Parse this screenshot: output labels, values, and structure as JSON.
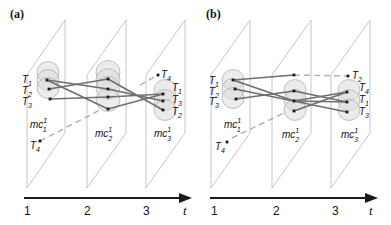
{
  "colors": {
    "plane": "#b8b8b8",
    "cluster_fill": "#dcdcdc",
    "cluster_stroke": "#a8a8a8",
    "link": "#6e6e6e",
    "dash": "#b0b0b0",
    "point": "#1a1a1a",
    "axis": "#1a1a1a"
  },
  "panels": [
    {
      "id": "a",
      "label": "(a)",
      "label_pos": [
        10,
        18
      ],
      "axis": {
        "x1": 24,
        "x2": 192,
        "y": 198,
        "ticks": [
          {
            "label": "1",
            "x": 27
          },
          {
            "label": "2",
            "x": 87
          },
          {
            "label": "3",
            "x": 146
          }
        ],
        "t_label": "t",
        "t_x": 183
      },
      "planes": [
        {
          "left_x": 27,
          "right_x": 65,
          "top_y": 20,
          "bottom_y": 188,
          "skew": 55
        },
        {
          "left_x": 87,
          "right_x": 126,
          "top_y": 20,
          "bottom_y": 188,
          "skew": 55
        },
        {
          "left_x": 146,
          "right_x": 185,
          "top_y": 20,
          "bottom_y": 188,
          "skew": 55
        }
      ],
      "clusters": [
        {
          "name": "mc",
          "sub": "1",
          "sup": "1",
          "label_pos": [
            30,
            128
          ],
          "circles": [
            [
              48,
              72
            ],
            [
              48,
              80
            ],
            [
              48,
              88
            ]
          ],
          "r": 11
        },
        {
          "name": "mc",
          "sub": "2",
          "sup": "1",
          "label_pos": [
            95,
            137
          ],
          "circles": [
            [
              108,
              72
            ],
            [
              108,
              80
            ],
            [
              108,
              88
            ],
            [
              108,
              100
            ]
          ],
          "r": 12
        },
        {
          "name": "mc",
          "sub": "3",
          "sup": "1",
          "label_pos": [
            154,
            137
          ],
          "circles": [
            [
              165,
              90
            ],
            [
              165,
              100
            ],
            [
              165,
              110
            ]
          ],
          "r": 11
        }
      ],
      "points": [
        {
          "id": "p1a",
          "x": 47,
          "y": 80
        },
        {
          "id": "p1b",
          "x": 49,
          "y": 89
        },
        {
          "id": "p1c",
          "x": 50,
          "y": 99
        },
        {
          "id": "p2a",
          "x": 108,
          "y": 79
        },
        {
          "id": "p2b",
          "x": 108,
          "y": 89
        },
        {
          "id": "p2c",
          "x": 108,
          "y": 97
        },
        {
          "id": "p2d",
          "x": 108,
          "y": 109
        },
        {
          "id": "p3a",
          "x": 163,
          "y": 94
        },
        {
          "id": "p3b",
          "x": 163,
          "y": 101
        },
        {
          "id": "p3c",
          "x": 163,
          "y": 110
        },
        {
          "id": "p3d",
          "x": 158,
          "y": 75
        },
        {
          "id": "p1t4",
          "x": 40,
          "y": 141
        }
      ],
      "links": [
        [
          "p1a",
          "p2b"
        ],
        [
          "p1a",
          "p2d"
        ],
        [
          "p1b",
          "p2a"
        ],
        [
          "p1c",
          "p2c"
        ],
        [
          "p2a",
          "p3c"
        ],
        [
          "p2b",
          "p3b"
        ],
        [
          "p2c",
          "p3a"
        ],
        [
          "p2d",
          "p3a"
        ]
      ],
      "dashes": [
        {
          "x1": 40,
          "y1": 141,
          "x2": 100,
          "y2": 110
        },
        {
          "x1": 140,
          "y1": 85,
          "x2": 158,
          "y2": 75
        }
      ],
      "traj_labels": [
        {
          "text": "T",
          "sub": "1",
          "x": 22,
          "y": 83
        },
        {
          "text": "T",
          "sub": "2",
          "x": 22,
          "y": 94
        },
        {
          "text": "T",
          "sub": "3",
          "x": 22,
          "y": 105
        },
        {
          "text": "T",
          "sub": "4",
          "x": 30,
          "y": 149
        },
        {
          "text": "T",
          "sub": "4",
          "x": 161,
          "y": 78
        },
        {
          "text": "T",
          "sub": "1",
          "x": 172,
          "y": 91
        },
        {
          "text": "T",
          "sub": "3",
          "x": 172,
          "y": 103
        },
        {
          "text": "T",
          "sub": "2",
          "x": 172,
          "y": 115
        }
      ]
    },
    {
      "id": "b",
      "label": "(b)",
      "label_pos": [
        206,
        18
      ],
      "axis": {
        "x1": 210,
        "x2": 378,
        "y": 198,
        "ticks": [
          {
            "label": "1",
            "x": 214
          },
          {
            "label": "2",
            "x": 276
          },
          {
            "label": "3",
            "x": 335
          }
        ],
        "t_label": "t",
        "t_x": 369
      },
      "planes": [
        {
          "left_x": 211,
          "right_x": 250,
          "top_y": 20,
          "bottom_y": 188,
          "skew": 55
        },
        {
          "left_x": 272,
          "right_x": 311,
          "top_y": 20,
          "bottom_y": 188,
          "skew": 55
        },
        {
          "left_x": 331,
          "right_x": 370,
          "top_y": 20,
          "bottom_y": 188,
          "skew": 55
        }
      ],
      "clusters": [
        {
          "name": "mc",
          "sub": "1",
          "sup": "1",
          "label_pos": [
            224,
            128
          ],
          "circles": [
            [
              233,
              80
            ],
            [
              233,
              89
            ],
            [
              233,
              98
            ]
          ],
          "r": 11
        },
        {
          "name": "mc",
          "sub": "2",
          "sup": "1",
          "label_pos": [
            282,
            138
          ],
          "circles": [
            [
              295,
              90
            ],
            [
              295,
              100
            ],
            [
              295,
              110
            ]
          ],
          "r": 11
        },
        {
          "name": "mc",
          "sub": "3",
          "sup": "1",
          "label_pos": [
            341,
            138
          ],
          "circles": [
            [
              349,
              90
            ],
            [
              349,
              100
            ],
            [
              349,
              110
            ]
          ],
          "r": 11
        }
      ],
      "points": [
        {
          "id": "q1a",
          "x": 233,
          "y": 80
        },
        {
          "id": "q1b",
          "x": 235,
          "y": 89
        },
        {
          "id": "q1c",
          "x": 236,
          "y": 99
        },
        {
          "id": "q2top",
          "x": 294,
          "y": 75
        },
        {
          "id": "q2a",
          "x": 294,
          "y": 91
        },
        {
          "id": "q2b",
          "x": 294,
          "y": 101
        },
        {
          "id": "q2c",
          "x": 294,
          "y": 111
        },
        {
          "id": "q3a",
          "x": 347,
          "y": 92
        },
        {
          "id": "q3b",
          "x": 347,
          "y": 102
        },
        {
          "id": "q3c",
          "x": 347,
          "y": 112
        },
        {
          "id": "q3t2",
          "x": 348,
          "y": 76
        },
        {
          "id": "q1t4",
          "x": 227,
          "y": 142
        }
      ],
      "links": [
        [
          "q1a",
          "q2top"
        ],
        [
          "q1a",
          "q2b"
        ],
        [
          "q1b",
          "q3c"
        ],
        [
          "q1c",
          "q2a"
        ],
        [
          "q2a",
          "q3b"
        ],
        [
          "q2b",
          "q3a"
        ],
        [
          "q2b",
          "q3b"
        ],
        [
          "q2c",
          "q3a"
        ]
      ],
      "dashes": [
        {
          "x1": 294,
          "y1": 75,
          "x2": 348,
          "y2": 76
        },
        {
          "x1": 232,
          "y1": 138,
          "x2": 284,
          "y2": 113
        }
      ],
      "traj_labels": [
        {
          "text": "T",
          "sub": "1",
          "x": 209,
          "y": 84
        },
        {
          "text": "T",
          "sub": "2",
          "x": 209,
          "y": 95
        },
        {
          "text": "T",
          "sub": "3",
          "x": 209,
          "y": 105
        },
        {
          "text": "T",
          "sub": "4",
          "x": 215,
          "y": 150
        },
        {
          "text": "T",
          "sub": "2",
          "x": 352,
          "y": 79
        },
        {
          "text": "T",
          "sub": "4",
          "x": 359,
          "y": 91
        },
        {
          "text": "T",
          "sub": "1",
          "x": 359,
          "y": 103
        },
        {
          "text": "T",
          "sub": "3",
          "x": 359,
          "y": 115
        }
      ]
    }
  ]
}
